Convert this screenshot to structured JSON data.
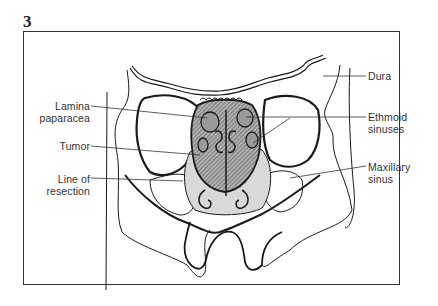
{
  "figure": {
    "number": "3"
  },
  "labels": {
    "lamina_line1": "Lamina",
    "lamina_line2": "paparacea",
    "tumor": "Tumor",
    "line_of_resection_line1": "Line of",
    "line_of_resection_line2": "resection",
    "dura": "Dura",
    "ethmoid_line1": "Ethmoid",
    "ethmoid_line2": "sinuses",
    "maxillary_line1": "Maxillary",
    "maxillary_line2": "sinus"
  },
  "colors": {
    "line": "#1a1a1a",
    "tumor_fill": "#8a8a8a",
    "resection_fill": "#d9d9d9",
    "background": "#ffffff"
  }
}
